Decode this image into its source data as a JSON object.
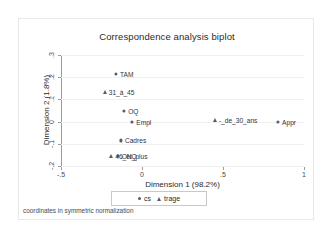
{
  "chart_data": {
    "type": "scatter",
    "title": "Correspondence analysis biplot",
    "xlabel": "Dimension 1 (98.2%)",
    "ylabel": "Dimension 2 (1.8%)",
    "xlim": [
      -0.5,
      1.0
    ],
    "ylim": [
      -0.2,
      0.3
    ],
    "xticks": [
      -0.5,
      0,
      0.5,
      1
    ],
    "xticklabels": [
      "-.5",
      "0",
      ".5",
      "1"
    ],
    "yticks": [
      0.3,
      0.2,
      0.1,
      0,
      -0.1,
      -0.2
    ],
    "yticklabels": [
      ".3",
      ".2",
      ".1",
      "0",
      "-.1",
      "-.2"
    ],
    "grid": true,
    "legend_position": "bottom-center",
    "note": "coordinates in symmetric normalization",
    "series": [
      {
        "name": "cs",
        "marker": "circle",
        "color": "#5a5a6e",
        "points": [
          {
            "label": "TAM",
            "x": -0.16,
            "y": 0.215
          },
          {
            "label": "OQ",
            "x": -0.11,
            "y": 0.05
          },
          {
            "label": "Empl",
            "x": -0.06,
            "y": 0.0
          },
          {
            "label": "Cadres",
            "x": -0.13,
            "y": -0.085
          },
          {
            "label": "ONQ",
            "x": -0.15,
            "y": -0.155
          },
          {
            "label": "Appr",
            "x": 0.84,
            "y": 0.0
          }
        ]
      },
      {
        "name": "trage",
        "marker": "triangle",
        "color": "#5a5a6e",
        "points": [
          {
            "label": "31_à_45",
            "x": -0.23,
            "y": 0.135
          },
          {
            "label": "-_de_30_ans",
            "x": 0.45,
            "y": 0.005
          },
          {
            "label": "46_et_plus",
            "x": -0.19,
            "y": -0.155
          }
        ]
      }
    ]
  },
  "legend": {
    "items": [
      {
        "label": "cs",
        "marker": "circle-marker-icon"
      },
      {
        "label": "trage",
        "marker": "triangle-marker-icon"
      }
    ]
  }
}
